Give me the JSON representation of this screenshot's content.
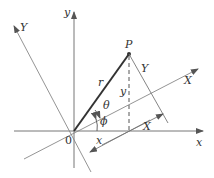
{
  "diagram": {
    "type": "coordinate-rotation",
    "labels": {
      "x_axis": "x",
      "y_axis": "y",
      "X_axis": "X",
      "Y_axis": "Y",
      "point": "P",
      "radius": "r",
      "theta": "θ",
      "phi": "ϕ",
      "origin": "0",
      "x_component": "x",
      "y_component": "y",
      "X_component": "X",
      "Y_component": "Y"
    },
    "colors": {
      "axis": "#777777",
      "radius": "#333333",
      "text": "#333333"
    }
  }
}
